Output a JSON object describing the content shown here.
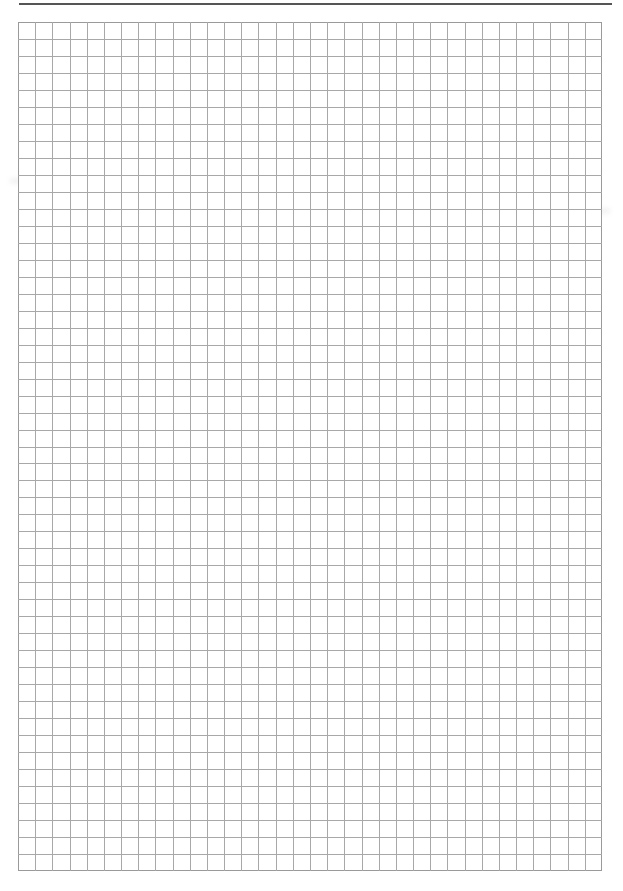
{
  "page": {
    "type": "graph-paper",
    "header_text": "",
    "grid": {
      "columns": 34,
      "rows": 50,
      "line_color": "#a8a8a8",
      "border_color": "#9a9a9a"
    },
    "header_rule_color": "#555555"
  }
}
